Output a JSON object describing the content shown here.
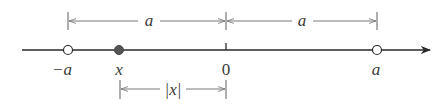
{
  "diagram": {
    "colors": {
      "axis": "#2a2a2a",
      "bracket": "#7a7a7a",
      "text": "#3a3a3a",
      "filled_point": "#555555",
      "open_point_fill": "#ffffff"
    },
    "axis": {
      "points": [
        {
          "id": "neg-a",
          "label": "−a",
          "type": "open"
        },
        {
          "id": "x",
          "label": "x",
          "type": "filled"
        },
        {
          "id": "zero",
          "label": "0",
          "type": "tick"
        },
        {
          "id": "pos-a",
          "label": "a",
          "type": "open"
        }
      ]
    },
    "brackets": {
      "top_left": {
        "label": "a",
        "from": "−a",
        "to": "0"
      },
      "top_right": {
        "label": "a",
        "from": "0",
        "to": "a"
      },
      "bottom": {
        "label": "|x|",
        "from": "x",
        "to": "0"
      }
    }
  }
}
